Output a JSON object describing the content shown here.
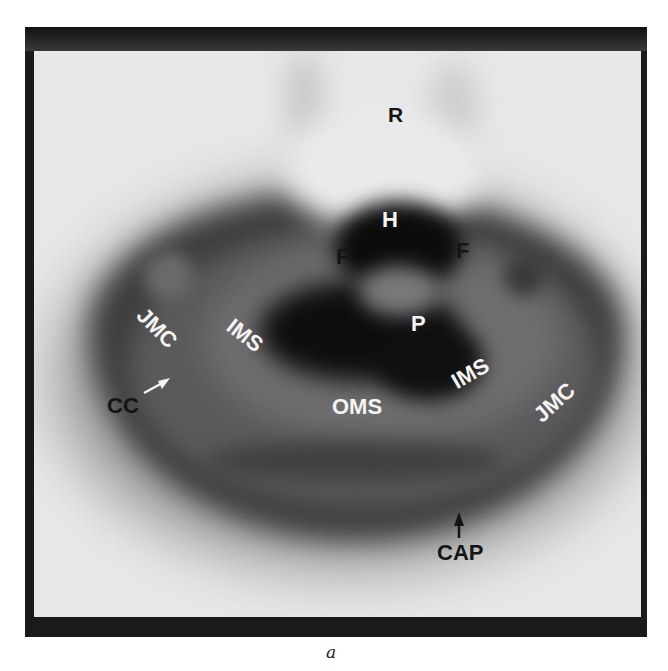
{
  "figure": {
    "caption": "a",
    "labels": {
      "R": "R",
      "H": "H",
      "F_left": "F",
      "F_right": "F",
      "P": "P",
      "JMC_left": "JMC",
      "IMS_left": "IMS",
      "CC": "CC",
      "OMS": "OMS",
      "IMS_right": "IMS",
      "JMC_right": "JMC",
      "CAP": "CAP"
    },
    "colors": {
      "background": "#e8e8e8",
      "frame": "#1a1a1a",
      "cortex": "#3c3c3c",
      "medulla": "#5a5a5a",
      "pelvis": "#0c0c0c"
    }
  }
}
